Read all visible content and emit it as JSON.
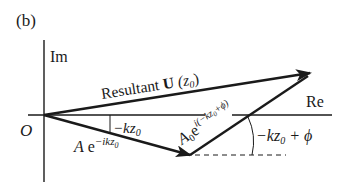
{
  "figure": {
    "panel_label": "(b)",
    "axes": {
      "imaginary_label": "Im",
      "real_label": "Re",
      "origin_label": "O"
    },
    "vectors": {
      "resultant": {
        "label_prefix": "Resultant ",
        "label_bold": "U",
        "label_arg": " (z",
        "label_sub": "0",
        "label_close": ")"
      },
      "first": {
        "label_A": "A",
        "label_e": " e",
        "label_sup": "−ikz",
        "label_sup_sub": "0"
      },
      "second": {
        "label_A0": "A",
        "label_A0_sub": "0",
        "label_e": "e",
        "label_sup": "i(−kz",
        "label_sup_sub": "0",
        "label_sup_end": "+ϕ)"
      }
    },
    "angles": {
      "first_angle": {
        "text": "−kz",
        "sub": "0"
      },
      "second_angle": {
        "text": "−kz",
        "sub": "0",
        "rest": " + ϕ"
      }
    },
    "colors": {
      "ink": "#1a1a1a",
      "background": "#ffffff"
    }
  }
}
